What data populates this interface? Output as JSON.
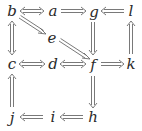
{
  "diagram": {
    "type": "commutative-diagram",
    "nodes": {
      "b": {
        "label": "b",
        "x": 12,
        "y": 11
      },
      "a": {
        "label": "a",
        "x": 53,
        "y": 11
      },
      "g": {
        "label": "g",
        "x": 94,
        "y": 12
      },
      "l": {
        "label": "l",
        "x": 131,
        "y": 11
      },
      "e": {
        "label": "e",
        "x": 52,
        "y": 38
      },
      "c": {
        "label": "c",
        "x": 12,
        "y": 64
      },
      "d": {
        "label": "d",
        "x": 53,
        "y": 64
      },
      "f": {
        "label": "f",
        "x": 93,
        "y": 65
      },
      "k": {
        "label": "k",
        "x": 131,
        "y": 64
      },
      "j": {
        "label": "j",
        "x": 12,
        "y": 118
      },
      "i": {
        "label": "i",
        "x": 53,
        "y": 117
      },
      "h": {
        "label": "h",
        "x": 93,
        "y": 117
      }
    },
    "edges": [
      {
        "from": "b",
        "to": "a",
        "style": "double-headed-double-arrow"
      },
      {
        "from": "a",
        "to": "g",
        "style": "double-arrow"
      },
      {
        "from": "l",
        "to": "g",
        "style": "double-arrow"
      },
      {
        "from": "b",
        "to": "c",
        "style": "double-headed-double-arrow"
      },
      {
        "from": "b",
        "to": "e",
        "style": "double-arrow"
      },
      {
        "from": "e",
        "to": "f",
        "style": "double-arrow"
      },
      {
        "from": "g",
        "to": "f",
        "style": "double-arrow"
      },
      {
        "from": "k",
        "to": "l",
        "style": "double-arrow"
      },
      {
        "from": "c",
        "to": "d",
        "style": "double-headed-double-arrow"
      },
      {
        "from": "d",
        "to": "f",
        "style": "double-headed-double-arrow"
      },
      {
        "from": "f",
        "to": "k",
        "style": "double-arrow"
      },
      {
        "from": "f",
        "to": "h",
        "style": "double-arrow"
      },
      {
        "from": "j",
        "to": "c",
        "style": "double-arrow"
      },
      {
        "from": "i",
        "to": "j",
        "style": "double-arrow"
      },
      {
        "from": "h",
        "to": "i",
        "style": "double-arrow"
      }
    ],
    "colors": {
      "stroke": "#6a6a6a",
      "text": "#2a2a2a",
      "background": "#ffffff"
    }
  }
}
